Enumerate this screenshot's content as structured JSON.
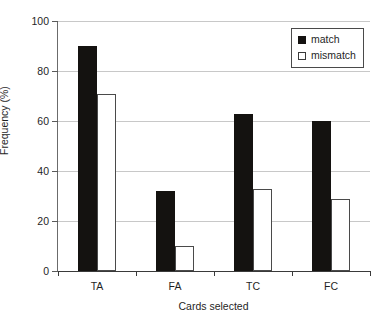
{
  "chart_data": {
    "type": "bar",
    "title": "",
    "xlabel": "Cards selected",
    "ylabel": "Frequency (%)",
    "categories": [
      "TA",
      "FA",
      "TC",
      "FC"
    ],
    "series": [
      {
        "name": "match",
        "values": [
          90,
          32,
          63,
          60
        ],
        "color": "#141210"
      },
      {
        "name": "mismatch",
        "values": [
          71,
          10,
          33,
          29
        ],
        "color": "#ffffff"
      }
    ],
    "ylim": [
      0,
      100
    ],
    "yticks": [
      0,
      20,
      40,
      60,
      80,
      100
    ],
    "ytick_labels": [
      "0",
      "20",
      "40",
      "60",
      "80",
      "100"
    ],
    "grid": true,
    "legend_position": "top-right",
    "legend_entries": [
      "match",
      "mismatch"
    ]
  }
}
